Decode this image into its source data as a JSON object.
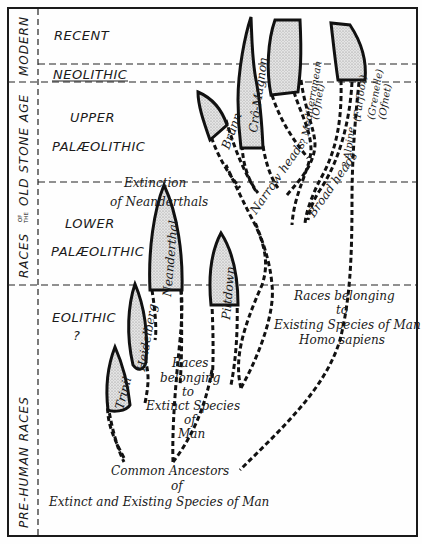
{
  "side_labels": {
    "modern": "MODERN",
    "old_stone_age_prefix": "RACES",
    "old_stone_age_of": "OF",
    "old_stone_age_the": "THE",
    "old_stone_age_suffix": "OLD  STONE  AGE",
    "pre_human": "PRE-HUMAN  RACES"
  },
  "eras": {
    "recent": "RECENT",
    "neolithic": "NEOLITHIC",
    "upper_1": "UPPER",
    "upper_2": "PALÆOLITHIC",
    "lower_1": "LOWER",
    "lower_2": "PALÆOLITHIC",
    "eolithic": "EOLITHIC",
    "eolithic_q": "?"
  },
  "races": {
    "trinil": "Trinil",
    "heidelberg": "Heidelberg",
    "neanderthal": "Neanderthal",
    "piltdown": "Piltdown",
    "brunn": "Brünn",
    "cro_magnon": "Crô-Magnon",
    "mediterranean": "? Mediterranean",
    "mediterranean_ofnet": "(Ofnet)",
    "alpine": "? Alpine",
    "alpine_furfooz": "(Furfooz)",
    "grenelle": "(Grenelle)",
    "grenelle_ofnet": "(Ofnet)",
    "narrow_heads": "Narrow heads",
    "broad_heads": "Broad heads"
  },
  "notes": {
    "extinction_1": "Extinction",
    "extinction_2": "of Neanderthals",
    "extinct_1": "Races",
    "extinct_2": "belonging",
    "extinct_3": "to",
    "extinct_4": "Extinct Species",
    "extinct_5": "of",
    "extinct_6": "Man",
    "existing_1": "Races belonging",
    "existing_2": "to",
    "existing_3": "Existing Species of Man",
    "existing_4": "Homo sapiens",
    "common_1": "Common Ancestors",
    "common_2": "of",
    "common_3": "Extinct and Existing Species of Man"
  },
  "colors": {
    "ink": "#111111",
    "leaf_fill": "#d6d6d6",
    "paper": "#fefefe"
  }
}
